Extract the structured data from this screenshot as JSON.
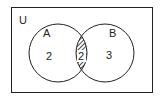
{
  "diagram": {
    "type": "venn",
    "universe_label": "U",
    "sets": [
      {
        "label": "A",
        "only_count": "2"
      },
      {
        "label": "B",
        "only_count": "3"
      }
    ],
    "intersection": {
      "count": "2",
      "shaded": true,
      "pattern": "diagonal-hatch"
    },
    "colors": {
      "stroke": "#222222",
      "background": "#ffffff"
    }
  }
}
